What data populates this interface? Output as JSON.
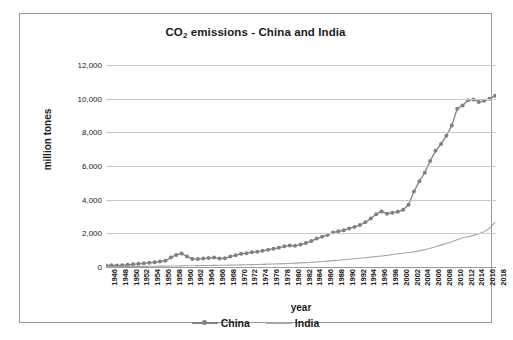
{
  "chart_data": {
    "type": "line",
    "title": "CO2 emissions - China and India",
    "title_prefix": "CO",
    "title_sub": "2",
    "title_suffix": " emissions - China and India",
    "xlabel": "year",
    "ylabel": "million tones",
    "ylim": [
      0,
      12000
    ],
    "yticks": [
      0,
      2000,
      4000,
      6000,
      8000,
      10000,
      12000
    ],
    "ytick_labels": [
      "0",
      "2,000",
      "4,000",
      "6,000",
      "8,000",
      "10,000",
      "12,000"
    ],
    "grid": true,
    "legend_position": "bottom",
    "xlim": [
      1946,
      2018
    ],
    "x": [
      1946,
      1947,
      1948,
      1949,
      1950,
      1951,
      1952,
      1953,
      1954,
      1955,
      1956,
      1957,
      1958,
      1959,
      1960,
      1961,
      1962,
      1963,
      1964,
      1965,
      1966,
      1967,
      1968,
      1969,
      1970,
      1971,
      1972,
      1973,
      1974,
      1975,
      1976,
      1977,
      1978,
      1979,
      1980,
      1981,
      1982,
      1983,
      1984,
      1985,
      1986,
      1987,
      1988,
      1989,
      1990,
      1991,
      1992,
      1993,
      1994,
      1995,
      1996,
      1997,
      1998,
      1999,
      2000,
      2001,
      2002,
      2003,
      2004,
      2005,
      2006,
      2007,
      2008,
      2009,
      2010,
      2011,
      2012,
      2013,
      2014,
      2015,
      2016,
      2017,
      2018
    ],
    "xtick_labels": [
      "1946",
      "1948",
      "1950",
      "1952",
      "1954",
      "1956",
      "1958",
      "1960",
      "1962",
      "1964",
      "1966",
      "1968",
      "1970",
      "1972",
      "1974",
      "1976",
      "1978",
      "1980",
      "1982",
      "1984",
      "1986",
      "1988",
      "1990",
      "1992",
      "1994",
      "1996",
      "1998",
      "2000",
      "2002",
      "2004",
      "2006",
      "2008",
      "2010",
      "2012",
      "2014",
      "2016",
      "2018"
    ],
    "series": [
      {
        "name": "China",
        "color": "#808080",
        "marker": "circle",
        "values": [
          90,
          100,
          95,
          110,
          130,
          160,
          190,
          220,
          250,
          280,
          330,
          370,
          560,
          720,
          800,
          620,
          480,
          470,
          500,
          530,
          560,
          500,
          520,
          620,
          700,
          780,
          820,
          880,
          900,
          960,
          1030,
          1080,
          1150,
          1230,
          1270,
          1260,
          1330,
          1420,
          1540,
          1690,
          1790,
          1900,
          2050,
          2120,
          2180,
          2290,
          2380,
          2490,
          2660,
          2880,
          3140,
          3300,
          3170,
          3220,
          3280,
          3400,
          3700,
          4480,
          5100,
          5600,
          6300,
          6900,
          7300,
          7800,
          8400,
          9400,
          9600,
          9900,
          9950,
          9800,
          9870,
          10000,
          10170
        ]
      },
      {
        "name": "India",
        "color": "#a6a6a6",
        "marker": "none",
        "values": [
          25,
          27,
          28,
          30,
          32,
          35,
          38,
          40,
          43,
          46,
          50,
          54,
          58,
          62,
          66,
          70,
          74,
          80,
          86,
          92,
          97,
          100,
          106,
          112,
          120,
          125,
          130,
          140,
          148,
          158,
          170,
          178,
          188,
          198,
          210,
          228,
          246,
          262,
          282,
          304,
          326,
          350,
          378,
          402,
          430,
          460,
          490,
          520,
          552,
          588,
          620,
          652,
          688,
          738,
          790,
          820,
          860,
          900,
          960,
          1030,
          1110,
          1200,
          1300,
          1390,
          1500,
          1620,
          1740,
          1800,
          1880,
          1980,
          2100,
          2300,
          2650
        ]
      }
    ]
  },
  "legend": {
    "items": [
      {
        "label": "China",
        "color": "#808080",
        "has_marker": true
      },
      {
        "label": "India",
        "color": "#a6a6a6",
        "has_marker": false
      }
    ]
  },
  "colors": {
    "china": "#808080",
    "india": "#a6a6a6",
    "grid": "#c8c8c8",
    "axis": "#9a9a9a",
    "text": "#1a1a1a",
    "border": "#9a9a9a",
    "background": "#ffffff"
  }
}
